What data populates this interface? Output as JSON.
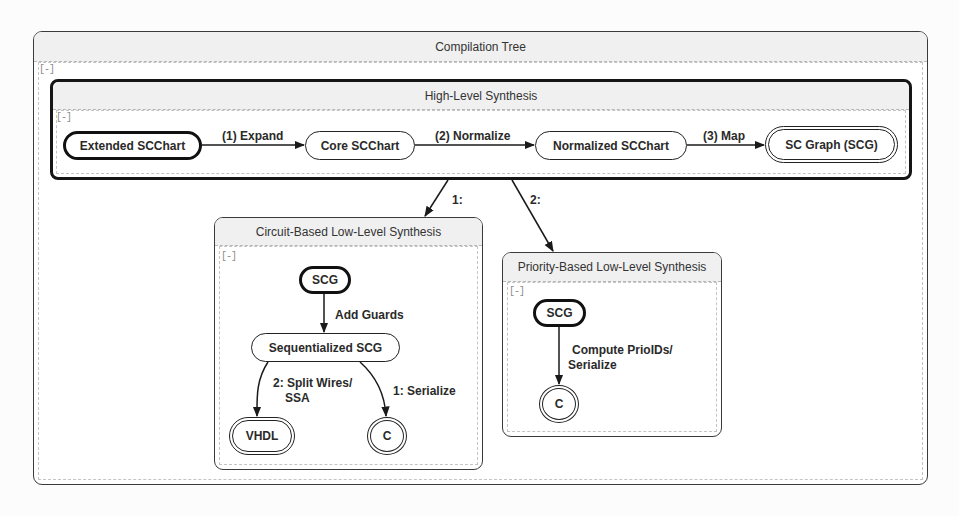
{
  "diagram": {
    "title": "Compilation Tree",
    "collapse_label": "[-]",
    "high_level": {
      "title": "High-Level Synthesis",
      "collapse_label": "[-]",
      "nodes": [
        {
          "label": "Extended SCChart",
          "kind": "initial"
        },
        {
          "label": "Core SCChart",
          "kind": "normal"
        },
        {
          "label": "Normalized SCChart",
          "kind": "normal"
        },
        {
          "label": "SC Graph (SCG)",
          "kind": "final"
        }
      ],
      "edges": [
        {
          "label": "(1) Expand",
          "from": "Extended SCChart",
          "to": "Core SCChart"
        },
        {
          "label": "(2) Normalize",
          "from": "Core SCChart",
          "to": "Normalized SCChart"
        },
        {
          "label": "(3) Map",
          "from": "Normalized SCChart",
          "to": "SC Graph (SCG)"
        }
      ]
    },
    "branches": [
      {
        "label": "1:",
        "to": "Circuit-Based Low-Level Synthesis"
      },
      {
        "label": "2:",
        "to": "Priority-Based Low-Level Synthesis"
      }
    ],
    "circuit": {
      "title": "Circuit-Based Low-Level Synthesis",
      "collapse_label": "[-]",
      "nodes": [
        {
          "label": "SCG",
          "kind": "initial"
        },
        {
          "label": "Sequentialized SCG",
          "kind": "normal"
        },
        {
          "label": "VHDL",
          "kind": "final"
        },
        {
          "label": "C",
          "kind": "final"
        }
      ],
      "edges": [
        {
          "label": "Add Guards",
          "from": "SCG",
          "to": "Sequentialized SCG"
        },
        {
          "label_line1": "2: Split Wires/",
          "label_line2": "SSA",
          "from": "Sequentialized SCG",
          "to": "VHDL"
        },
        {
          "label": "1: Serialize",
          "from": "Sequentialized SCG",
          "to": "C"
        }
      ]
    },
    "priority": {
      "title": "Priority-Based Low-Level Synthesis",
      "collapse_label": "[-]",
      "nodes": [
        {
          "label": "SCG",
          "kind": "initial"
        },
        {
          "label": "C",
          "kind": "final"
        }
      ],
      "edges": [
        {
          "label_line1": "Compute PrioIDs/",
          "label_line2": "Serialize",
          "from": "SCG",
          "to": "C"
        }
      ]
    }
  }
}
